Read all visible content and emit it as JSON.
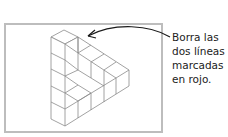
{
  "instruction": {
    "lines": [
      "Borra las",
      "dos líneas",
      "marcadas",
      "en rojo."
    ]
  },
  "figure": {
    "stroke_color": "#8a8a8a",
    "frame_color": "#bdbdbd",
    "arrow_color": "#1a1a1a"
  }
}
